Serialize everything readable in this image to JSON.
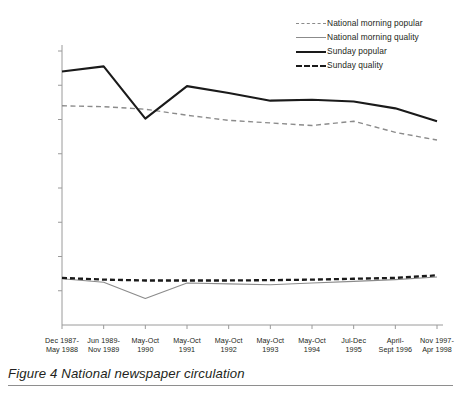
{
  "caption": {
    "label": "Figure 4",
    "text": "Figure 4   National newspaper circulation"
  },
  "colors": {
    "popular_dash": "#8b8b8b",
    "quality_gray": "#8b8b8b",
    "sunday_popular": "#1a1a1a",
    "sunday_quality": "#1a1a1a",
    "axis": "#9a9a9a",
    "text": "#231f20",
    "rule": "#8e8e8e"
  },
  "legend": {
    "position": "top-right",
    "items": [
      {
        "label": "National morning popular",
        "style": "dashed",
        "color": "#8b8b8b",
        "width": 1.4
      },
      {
        "label": "National morning quality",
        "style": "solid",
        "color": "#8b8b8b",
        "width": 1.1
      },
      {
        "label": "Sunday popular",
        "style": "solid",
        "color": "#1a1a1a",
        "width": 2.1
      },
      {
        "label": "Sunday quality",
        "style": "dashed",
        "color": "#1a1a1a",
        "width": 2.3
      }
    ]
  },
  "chart_data": {
    "type": "line",
    "title": "National newspaper circulation",
    "xlabel": "",
    "ylabel": "",
    "grid": false,
    "ylim": [
      0,
      16000000
    ],
    "yticks": [
      0,
      2000000,
      4000000,
      6000000,
      8000000,
      10000000,
      12000000,
      14000000,
      16000000
    ],
    "ytick_labels": [
      "0",
      "2,000,000",
      "4,000,000",
      "6,000,000",
      "8,000,000",
      "10,000,000",
      "12,000,000",
      "14,000,000",
      "16,000,000"
    ],
    "categories": [
      "Dec 1987-\nMay 1988",
      "Jun 1989-\nNov 1989",
      "May-Oct\n1990",
      "May-Oct\n1991",
      "May-Oct\n1992",
      "May-Oct\n1993",
      "May-Oct\n1994",
      "Jul-Dec\n1995",
      "April-\nSept 1996",
      "Nov 1997-\nApr 1998"
    ],
    "categories_line1": [
      "Dec 1987-",
      "Jun 1989-",
      "May-Oct",
      "May-Oct",
      "May-Oct",
      "May-Oct",
      "May-Oct",
      "Jul-Dec",
      "April-",
      "Nov 1997-"
    ],
    "categories_line2": [
      "May 1988",
      "Nov 1989",
      "1990",
      "1991",
      "1992",
      "1993",
      "1994",
      "1995",
      "Sept 1996",
      "Apr 1998"
    ],
    "series": [
      {
        "name": "National morning popular",
        "values": [
          12800000,
          12750000,
          12600000,
          12250000,
          11950000,
          11800000,
          11650000,
          11900000,
          11250000,
          10800000
        ]
      },
      {
        "name": "National morning quality",
        "values": [
          2700000,
          2500000,
          1550000,
          2450000,
          2400000,
          2350000,
          2450000,
          2550000,
          2650000,
          2800000
        ]
      },
      {
        "name": "Sunday popular",
        "values": [
          14800000,
          15100000,
          12050000,
          13950000,
          13550000,
          13100000,
          13150000,
          13050000,
          12650000,
          11900000
        ]
      },
      {
        "name": "Sunday quality",
        "values": [
          2750000,
          2650000,
          2600000,
          2600000,
          2600000,
          2620000,
          2650000,
          2700000,
          2750000,
          2900000
        ]
      }
    ]
  }
}
